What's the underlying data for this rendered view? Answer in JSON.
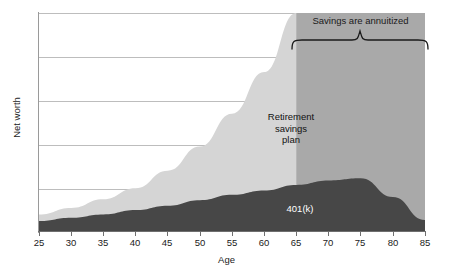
{
  "chart_data": {
    "type": "area",
    "title": "",
    "xlabel": "Age",
    "ylabel": "Net worth",
    "xlim": [
      25,
      85
    ],
    "ylim": [
      0,
      100
    ],
    "grid": true,
    "gridlines_y": [
      20,
      40,
      60,
      80,
      100
    ],
    "xticks": [
      25,
      30,
      35,
      40,
      45,
      50,
      55,
      60,
      65,
      70,
      75,
      80,
      85
    ],
    "yticks": [],
    "legend": "none",
    "x": [
      25,
      30,
      35,
      40,
      45,
      50,
      55,
      60,
      65,
      70,
      75,
      80,
      85
    ],
    "series": [
      {
        "name": "Total net worth",
        "color": "#d5d5d5",
        "values": [
          8,
          11,
          15,
          20,
          28,
          39,
          54,
          73,
          100,
          100,
          100,
          100,
          100
        ]
      },
      {
        "name": "401(k)",
        "color": "#474747",
        "values": [
          5,
          6.5,
          8,
          10,
          12,
          14.5,
          17,
          19,
          21.5,
          23.5,
          24.5,
          16,
          5.5
        ]
      }
    ],
    "annotations": [
      {
        "name": "annuitized-label",
        "text": "Savings are annuitized",
        "x_range": [
          65,
          85
        ]
      },
      {
        "name": "retirement-savings-plan-label",
        "text": "Retirement savings plan"
      },
      {
        "name": "k401-label",
        "text": "401(k)"
      }
    ]
  },
  "axes": {
    "x_title": "Age",
    "y_title": "Net worth",
    "x_tick_labels": [
      "25",
      "30",
      "35",
      "40",
      "45",
      "50",
      "55",
      "60",
      "65",
      "70",
      "75",
      "80",
      "85"
    ]
  },
  "annotations": {
    "annuitized": "Savings are annuitized",
    "retirement_plan_line1": "Retirement",
    "retirement_plan_line2": "savings",
    "retirement_plan_line3": "plan",
    "k401": "401(k)"
  },
  "colors": {
    "total_area": "#d5d5d5",
    "k401_area": "#474747",
    "annuitized_block": "#a9a9a9",
    "grid": "#bdbdbd",
    "axis": "#6f6f6f",
    "text": "#1a1a1a",
    "background": "#ffffff"
  }
}
